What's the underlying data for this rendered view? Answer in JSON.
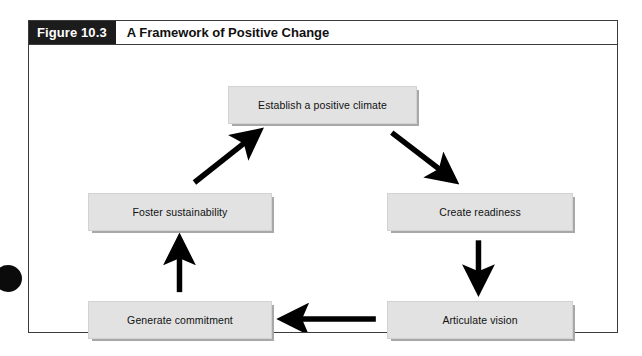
{
  "figure": {
    "number_label": "Figure 10.3",
    "title": "A Framework of Positive Change"
  },
  "diagram": {
    "type": "cycle-flow",
    "nodes": [
      {
        "id": "establish",
        "label": "Establish a positive climate",
        "position": "top-center"
      },
      {
        "id": "readiness",
        "label": "Create readiness",
        "position": "middle-right"
      },
      {
        "id": "vision",
        "label": "Articulate vision",
        "position": "bottom-right"
      },
      {
        "id": "commitment",
        "label": "Generate commitment",
        "position": "bottom-left"
      },
      {
        "id": "sustainability",
        "label": "Foster sustainability",
        "position": "middle-left"
      }
    ],
    "edges": [
      {
        "from": "establish",
        "to": "readiness",
        "direction": "diagonal-down-right"
      },
      {
        "from": "readiness",
        "to": "vision",
        "direction": "down"
      },
      {
        "from": "vision",
        "to": "commitment",
        "direction": "left"
      },
      {
        "from": "commitment",
        "to": "sustainability",
        "direction": "up"
      },
      {
        "from": "sustainability",
        "to": "establish",
        "direction": "diagonal-up-right"
      }
    ]
  },
  "colors": {
    "header_block": "#1c1c1c",
    "node_fill": "#e2e2e2",
    "node_shadow": "#a8a8a8",
    "arrow": "#000000",
    "frame_border": "#3b3b3b"
  }
}
